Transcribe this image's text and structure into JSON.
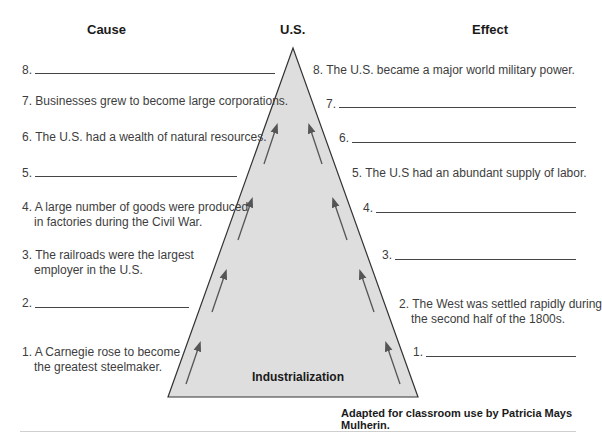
{
  "headers": {
    "cause": "Cause",
    "center": "U.S.",
    "effect": "Effect"
  },
  "triangle_label": "Industrialization",
  "causes": [
    {
      "num": "8.",
      "text": "",
      "blank": true
    },
    {
      "num": "7.",
      "text": "Businesses grew to become large corporations.",
      "blank": false
    },
    {
      "num": "6.",
      "text": "The U.S. had a wealth of natural resources.",
      "blank": false
    },
    {
      "num": "5.",
      "text": "",
      "blank": true
    },
    {
      "num": "4.",
      "line1": "A large number of goods were produced",
      "line2": "in factories during the Civil War.",
      "blank": false
    },
    {
      "num": "3.",
      "line1": "The railroads were the largest",
      "line2": "employer in the U.S.",
      "blank": false
    },
    {
      "num": "2.",
      "text": "",
      "blank": true
    },
    {
      "num": "1.",
      "line1": "A Carnegie rose to become",
      "line2": "the greatest steelmaker.",
      "blank": false
    }
  ],
  "effects": [
    {
      "num": "8.",
      "text": "The U.S. became a major world military power.",
      "blank": false
    },
    {
      "num": "7.",
      "text": "",
      "blank": true
    },
    {
      "num": "6.",
      "text": "",
      "blank": true
    },
    {
      "num": "5.",
      "text": "The U.S had an abundant supply of labor.",
      "blank": false
    },
    {
      "num": "4.",
      "text": "",
      "blank": true
    },
    {
      "num": "3.",
      "text": "",
      "blank": true
    },
    {
      "num": "2.",
      "line1": "The West was settled rapidly during",
      "line2": "the second half of the 1800s.",
      "blank": false
    },
    {
      "num": "1.",
      "text": "",
      "blank": true
    }
  ],
  "credit": "Adapted for classroom use by Patricia Mays Mulherin.",
  "colors": {
    "triangle_fill": "#dcdcdc",
    "triangle_stroke": "#333333",
    "arrow": "#555555"
  }
}
